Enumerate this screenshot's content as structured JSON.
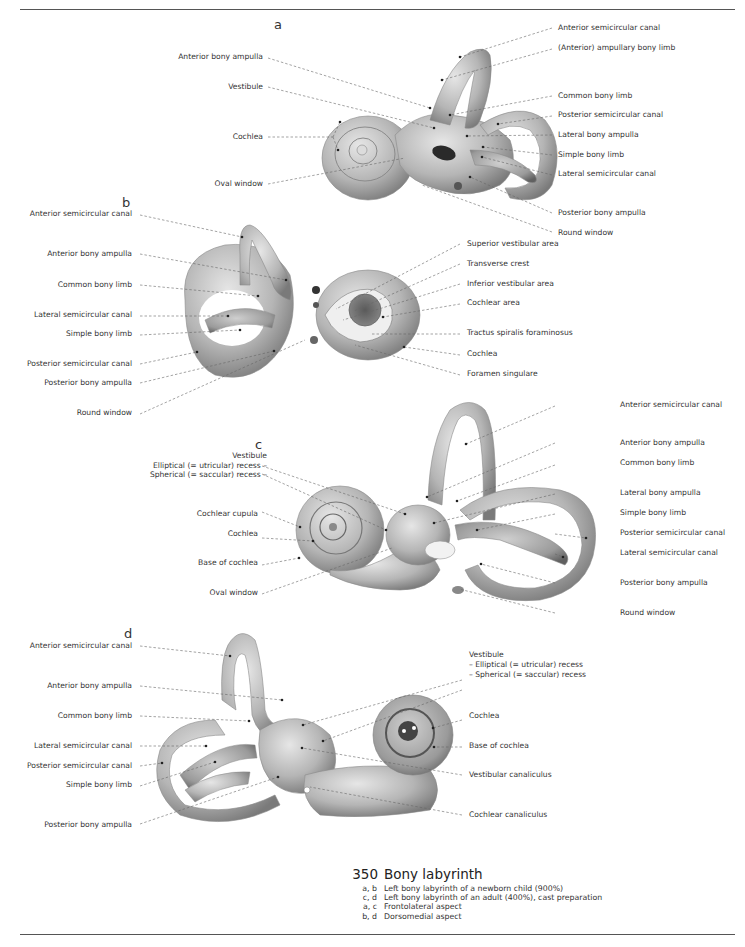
{
  "panels": {
    "a": {
      "letter": "a",
      "labels_left": [
        {
          "text": "Anterior bony ampulla"
        },
        {
          "text": "Vestibule"
        },
        {
          "text": "Cochlea"
        },
        {
          "text": "Oval window"
        }
      ],
      "labels_right": [
        {
          "text": "Anterior semicircular canal"
        },
        {
          "text": "(Anterior) ampullary bony limb"
        },
        {
          "text": "Common bony limb"
        },
        {
          "text": "Posterior semicircular canal"
        },
        {
          "text": "Lateral bony ampulla"
        },
        {
          "text": "Simple bony limb"
        },
        {
          "text": "Lateral semicircular canal"
        },
        {
          "text": "Posterior bony ampulla"
        },
        {
          "text": "Round window"
        }
      ]
    },
    "b": {
      "letter": "b",
      "labels_left": [
        {
          "text": "Anterior semicircular canal"
        },
        {
          "text": "Anterior bony ampulla"
        },
        {
          "text": "Common bony limb"
        },
        {
          "text": "Lateral semicircular canal"
        },
        {
          "text": "Simple bony limb"
        },
        {
          "text": "Posterior semicircular canal"
        },
        {
          "text": "Posterior bony ampulla"
        },
        {
          "text": "Round window"
        }
      ],
      "labels_right": [
        {
          "text": "Superior vestibular area"
        },
        {
          "text": "Transverse crest"
        },
        {
          "text": "Inferior vestibular area"
        },
        {
          "text": "Cochlear area"
        },
        {
          "text": "Tractus spiralis foraminosus"
        },
        {
          "text": "Cochlea"
        },
        {
          "text": "Foramen singulare"
        }
      ]
    },
    "c": {
      "letter": "c",
      "labels_left": [
        {
          "text": "Vestibule"
        },
        {
          "text": "Elliptical (= utricular) recess –"
        },
        {
          "text": "Spherical (= saccular) recess –"
        },
        {
          "text": "Cochlear cupula"
        },
        {
          "text": "Cochlea"
        },
        {
          "text": "Base of cochlea"
        },
        {
          "text": "Oval window"
        }
      ],
      "labels_right": [
        {
          "text": "Anterior semicircular canal"
        },
        {
          "text": "Anterior bony ampulla"
        },
        {
          "text": "Common bony limb"
        },
        {
          "text": "Lateral bony ampulla"
        },
        {
          "text": "Simple bony limb"
        },
        {
          "text": "Posterior semicircular canal"
        },
        {
          "text": "Lateral semicircular canal"
        },
        {
          "text": "Posterior bony ampulla"
        },
        {
          "text": "Round window"
        }
      ]
    },
    "d": {
      "letter": "d",
      "labels_left": [
        {
          "text": "Anterior semicircular canal"
        },
        {
          "text": "Anterior bony ampulla"
        },
        {
          "text": "Common bony limb"
        },
        {
          "text": "Lateral semicircular canal"
        },
        {
          "text": "Posterior semicircular canal"
        },
        {
          "text": "Simple bony limb"
        },
        {
          "text": "Posterior bony ampulla"
        }
      ],
      "labels_right": [
        {
          "text": "Vestibule"
        },
        {
          "text": "– Elliptical (= utricular) recess"
        },
        {
          "text": "– Spherical (= saccular) recess"
        },
        {
          "text": "Cochlea"
        },
        {
          "text": "Base of cochlea"
        },
        {
          "text": "Vestibular canaliculus"
        },
        {
          "text": "Cochlear canaliculus"
        }
      ]
    }
  },
  "caption": {
    "number": "350",
    "title": "Bony labyrinth",
    "rows": [
      {
        "key": "a, b",
        "text": "Left bony labyrinth of a newborn child (900%)"
      },
      {
        "key": "c, d",
        "text": "Left bony labyrinth of an adult (400%), cast preparation"
      },
      {
        "key": "a, c",
        "text": "Frontolateral aspect"
      },
      {
        "key": "b, d",
        "text": "Dorsomedial aspect"
      }
    ]
  },
  "colors": {
    "bone_light": "#d8d8d8",
    "bone_mid": "#a9a9a9",
    "bone_dark": "#6e6e6e",
    "leader_line": "#666666",
    "text": "#333333"
  }
}
